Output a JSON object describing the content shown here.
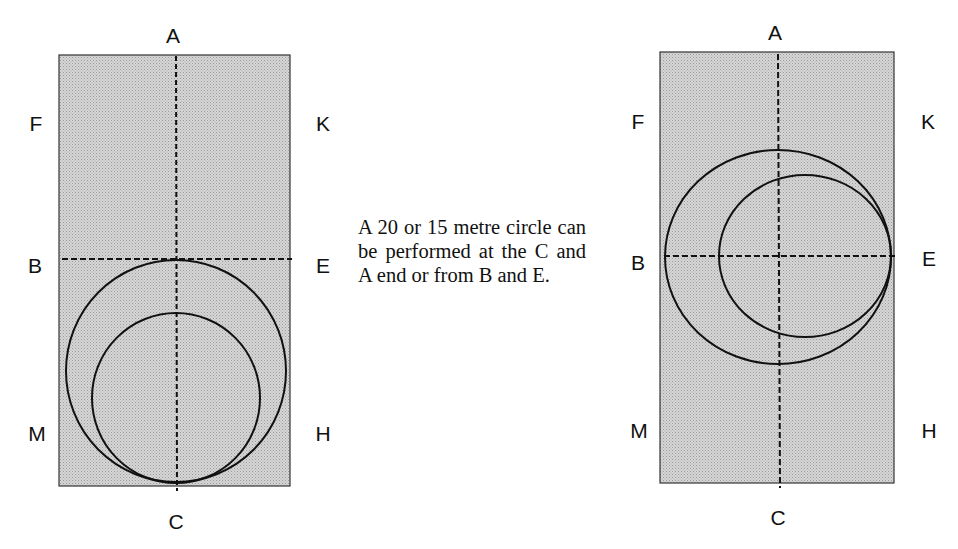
{
  "caption": "A 20 or 15 metre circle can be performed at the C and A end or from B and E.",
  "colors": {
    "arena_fill": "#cfcfcf",
    "line": "#111111",
    "background": "#ffffff"
  },
  "left_diagram": {
    "title": "Circles at the C end",
    "markers": {
      "top": "A",
      "bottom": "C",
      "left_upper": "F",
      "left_mid": "B",
      "left_lower": "M",
      "right_upper": "K",
      "right_mid": "E",
      "right_lower": "H"
    },
    "circles": [
      {
        "name": "20 metre circle",
        "cx": 176,
        "cy": 371,
        "rx": 110,
        "ry": 111
      },
      {
        "name": "15 metre circle",
        "cx": 176,
        "cy": 398,
        "rx": 84,
        "ry": 85
      }
    ]
  },
  "right_diagram": {
    "title": "Circles from B and E",
    "markers": {
      "top": "A",
      "bottom": "C",
      "left_upper": "F",
      "left_mid": "B",
      "left_lower": "M",
      "right_upper": "K",
      "right_mid": "E",
      "right_lower": "H"
    },
    "circles": [
      {
        "name": "20 metre circle",
        "cx": 778,
        "cy": 257,
        "rx": 113,
        "ry": 107
      },
      {
        "name": "15 metre circle",
        "cx": 805,
        "cy": 256,
        "rx": 86,
        "ry": 81
      }
    ]
  }
}
